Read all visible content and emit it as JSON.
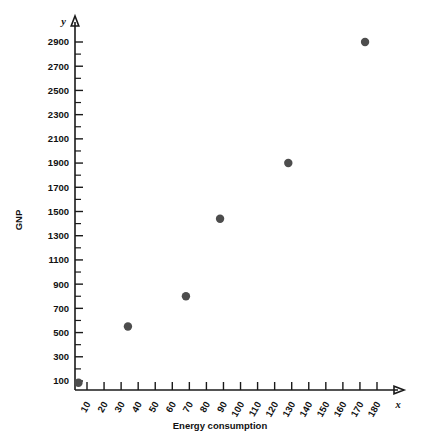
{
  "chart_data": {
    "type": "scatter",
    "title": "",
    "xlabel": "Energy consumption",
    "ylabel": "GNP",
    "x_axis_symbol": "x",
    "y_axis_symbol": "y",
    "xlim": [
      0,
      185
    ],
    "ylim": [
      0,
      3000
    ],
    "grid": false,
    "legend": null,
    "x_tick_labels": [
      "10",
      "20",
      "30",
      "40",
      "50",
      "60",
      "70",
      "80",
      "90",
      "100",
      "110",
      "120",
      "130",
      "140",
      "150",
      "160",
      "170",
      "180"
    ],
    "x_ticks": [
      10,
      20,
      30,
      40,
      50,
      60,
      70,
      80,
      90,
      100,
      110,
      120,
      130,
      140,
      150,
      160,
      170,
      180
    ],
    "y_tick_labels": [
      "100",
      "300",
      "500",
      "700",
      "900",
      "1100",
      "1300",
      "1500",
      "1700",
      "1900",
      "2100",
      "2300",
      "2500",
      "2700",
      "2900"
    ],
    "y_ticks": [
      100,
      300,
      500,
      700,
      900,
      1100,
      1300,
      1500,
      1700,
      1900,
      2100,
      2300,
      2500,
      2700,
      2900
    ],
    "y_minor_ticks": [
      200,
      400,
      600,
      800,
      1000,
      1200,
      1400,
      1600,
      1800,
      2000,
      2200,
      2400,
      2600,
      2800
    ],
    "points": [
      {
        "x": 5,
        "y": 85
      },
      {
        "x": 34,
        "y": 550
      },
      {
        "x": 68,
        "y": 800
      },
      {
        "x": 88,
        "y": 1440
      },
      {
        "x": 128,
        "y": 1900
      },
      {
        "x": 173,
        "y": 2900
      }
    ],
    "marker": {
      "shape": "circle",
      "color": "#4d4d4d",
      "size": 4.2
    }
  }
}
